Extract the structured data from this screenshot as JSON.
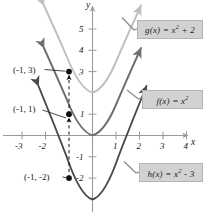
{
  "figure": {
    "axes": {
      "x_axis_label": "x",
      "y_axis_label": "y",
      "x_ticks": [
        "-3",
        "-2",
        "1",
        "2",
        "3",
        "4"
      ],
      "y_ticks": [
        "5",
        "4",
        "3",
        "1",
        "-1",
        "-2"
      ],
      "x_range": [
        -3.6,
        4.8
      ],
      "y_range": [
        -3.9,
        6.3
      ]
    },
    "legend": [
      {
        "id": "g",
        "text_html": "g(x) = x<sup>2</sup> + 2",
        "text": "g(x) = x^2 + 2",
        "color": "#bfbfbf"
      },
      {
        "id": "f",
        "text_html": "f(x) = x<sup>2</sup>",
        "text": "f(x) = x^2",
        "color": "#6e6e6e"
      },
      {
        "id": "h",
        "text_html": "h(x) = x<sup>2</sup> - 3",
        "text": "h(x) = x^2 - 3",
        "color": "#4a4a4a"
      }
    ],
    "points": [
      {
        "label": "(-1, 3)",
        "x": -1,
        "y": 3
      },
      {
        "label": "(-1, 1)",
        "x": -1,
        "y": 1
      },
      {
        "label": "(-1, -2)",
        "x": -1,
        "y": -2
      }
    ]
  },
  "chart_data": {
    "type": "line",
    "title": "",
    "xlabel": "x",
    "ylabel": "y",
    "xlim": [
      -3.6,
      4.8
    ],
    "ylim": [
      -3.9,
      6.3
    ],
    "grid": false,
    "legend_position": "right",
    "xticks": [
      -3,
      -2,
      1,
      2,
      3,
      4
    ],
    "yticks": [
      5,
      4,
      3,
      1,
      -1,
      -2
    ],
    "series": [
      {
        "name": "g(x) = x^2 + 2",
        "equation": "y = x^2 + 2",
        "color": "#bfbfbf",
        "vertex": [
          0,
          2
        ],
        "x": [
          -2.05,
          -1.5,
          -1.0,
          -0.5,
          0,
          0.5,
          1.0,
          1.5,
          2.05
        ],
        "y": [
          6.2,
          4.25,
          3.0,
          2.25,
          2.0,
          2.25,
          3.0,
          4.25,
          6.2
        ]
      },
      {
        "name": "f(x) = x^2",
        "equation": "y = x^2",
        "color": "#6e6e6e",
        "vertex": [
          0,
          0
        ],
        "x": [
          -2.05,
          -1.5,
          -1.0,
          -0.5,
          0,
          0.5,
          1.0,
          1.5,
          2.05
        ],
        "y": [
          4.2,
          2.25,
          1.0,
          0.25,
          0.0,
          0.25,
          1.0,
          2.25,
          4.2
        ]
      },
      {
        "name": "h(x) = x^2 - 3",
        "equation": "y = x^2 - 3",
        "color": "#4a4a4a",
        "vertex": [
          0,
          -3
        ],
        "x": [
          -2.3,
          -1.75,
          -1.0,
          -0.5,
          0,
          0.5,
          1.0,
          1.75,
          2.3
        ],
        "y": [
          2.29,
          0.06,
          -2.0,
          -2.75,
          -3.0,
          -2.75,
          -2.0,
          0.06,
          2.29
        ]
      }
    ],
    "annotations": [
      {
        "text": "(-1, 3)",
        "x": -1,
        "y": 3,
        "marker": "filled-circle"
      },
      {
        "text": "(-1, 1)",
        "x": -1,
        "y": 1,
        "marker": "filled-circle"
      },
      {
        "text": "(-1, -2)",
        "x": -1,
        "y": -2,
        "marker": "filled-circle"
      },
      {
        "text": "vertical shift arrows along x = -1",
        "x": -1,
        "y": 0,
        "marker": "dashed-double-arrow"
      }
    ]
  }
}
